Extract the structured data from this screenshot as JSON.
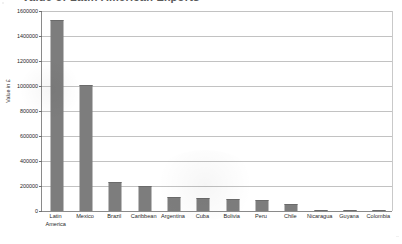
{
  "title_remnant": "Value of Latin American Exports",
  "axis": {
    "y_title": "Value in £",
    "y_ticks": [
      "1600000",
      "1400000",
      "1200000",
      "1000000",
      "800000",
      "600000",
      "400000",
      "200000",
      "0"
    ]
  },
  "chart_data": {
    "type": "bar",
    "title": "",
    "xlabel": "",
    "ylabel": "Value in £",
    "ylim": [
      0,
      1600000
    ],
    "ytick_step": 200000,
    "grid": true,
    "legend": "none",
    "bar_color": "#7d7d7d",
    "gridline_color": "#c2c2c2",
    "axis_color": "#8a8a8a",
    "categories": [
      "Latin America",
      "Mexico",
      "Brazil",
      "Caribbean",
      "Argentina",
      "Cuba",
      "Bolivia",
      "Peru",
      "Chile",
      "Nicaragua",
      "Guyana",
      "Colombia"
    ],
    "category_lines": [
      [
        "Latin",
        "America"
      ],
      [
        "Mexico"
      ],
      [
        "Brazil"
      ],
      [
        "Caribbean"
      ],
      [
        "Argentina"
      ],
      [
        "Cuba"
      ],
      [
        "Bolivia"
      ],
      [
        "Peru"
      ],
      [
        "Chile"
      ],
      [
        "Nicaragua"
      ],
      [
        "Guyana"
      ],
      [
        "Colombia"
      ]
    ],
    "values": [
      1525000,
      1010000,
      235000,
      197000,
      115000,
      105000,
      100000,
      92000,
      57000,
      10000,
      5000,
      2000
    ]
  }
}
